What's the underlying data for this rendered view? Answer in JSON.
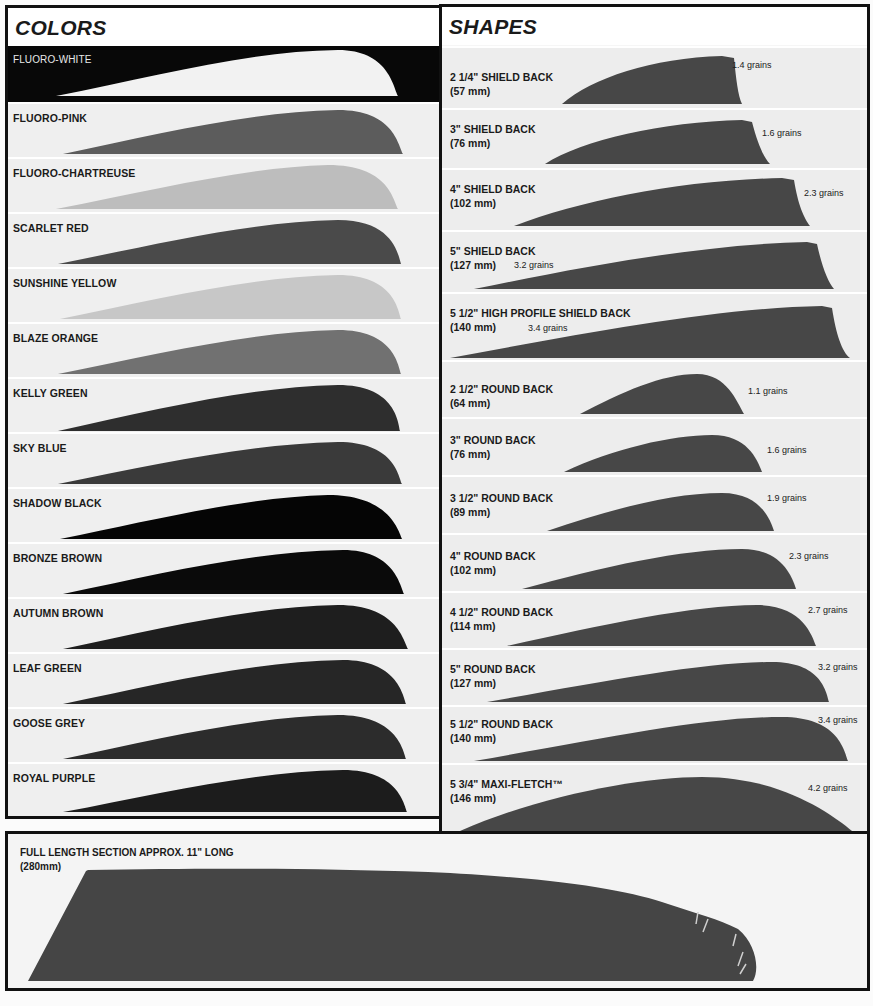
{
  "colors_panel": {
    "title": "COLORS",
    "items": [
      {
        "label": "FLUORO-WHITE",
        "fill": "#f2f2f2",
        "dark_row": true
      },
      {
        "label": "FLUORO-PINK",
        "fill": "#5c5c5c"
      },
      {
        "label": "FLUORO-CHARTREUSE",
        "fill": "#bdbdbd"
      },
      {
        "label": "SCARLET RED",
        "fill": "#4a4a4a"
      },
      {
        "label": "SUNSHINE YELLOW",
        "fill": "#c7c7c7"
      },
      {
        "label": "BLAZE ORANGE",
        "fill": "#717171"
      },
      {
        "label": "KELLY GREEN",
        "fill": "#2e2e2e"
      },
      {
        "label": "SKY BLUE",
        "fill": "#3a3a3a"
      },
      {
        "label": "SHADOW BLACK",
        "fill": "#050505"
      },
      {
        "label": "BRONZE BROWN",
        "fill": "#0a0a0a"
      },
      {
        "label": "AUTUMN BROWN",
        "fill": "#1e1e1e"
      },
      {
        "label": "LEAF GREEN",
        "fill": "#262626"
      },
      {
        "label": "GOOSE GREY",
        "fill": "#2c2c2c"
      },
      {
        "label": "ROYAL PURPLE",
        "fill": "#1c1c1c"
      }
    ]
  },
  "shapes_panel": {
    "title": "SHAPES",
    "fill": "#474747",
    "items": [
      {
        "label": "2 1/4\" SHIELD BACK",
        "size": "(57 mm)",
        "weight": "1.4 grains"
      },
      {
        "label": "3\" SHIELD BACK",
        "size": "(76 mm)",
        "weight": "1.6 grains"
      },
      {
        "label": "4\" SHIELD BACK",
        "size": "(102 mm)",
        "weight": "2.3 grains"
      },
      {
        "label": "5\" SHIELD BACK",
        "size": "(127 mm)",
        "weight": "3.2 grains"
      },
      {
        "label": "5 1/2\" HIGH PROFILE SHIELD BACK",
        "size": "(140 mm)",
        "weight": "3.4 grains"
      },
      {
        "label": "2 1/2\" ROUND BACK",
        "size": "(64 mm)",
        "weight": "1.1 grains"
      },
      {
        "label": "3\" ROUND BACK",
        "size": "(76 mm)",
        "weight": "1.6 grains"
      },
      {
        "label": "3 1/2\" ROUND BACK",
        "size": "(89 mm)",
        "weight": "1.9 grains"
      },
      {
        "label": "4\" ROUND BACK",
        "size": "(102 mm)",
        "weight": "2.3 grains"
      },
      {
        "label": "4 1/2\" ROUND BACK",
        "size": "(114 mm)",
        "weight": "2.7 grains"
      },
      {
        "label": "5\" ROUND BACK",
        "size": "(127 mm)",
        "weight": "3.2 grains"
      },
      {
        "label": "5 1/2\"  ROUND BACK",
        "size": "(140 mm)",
        "weight": "3.4 grains"
      },
      {
        "label": "5 3/4\" MAXI-FLETCH™",
        "size": "(146 mm)",
        "weight": "4.2 grains"
      }
    ]
  },
  "full_length_panel": {
    "label": "FULL LENGTH SECTION APPROX. 11\" LONG",
    "size": "(280mm)",
    "fill": "#454545"
  }
}
